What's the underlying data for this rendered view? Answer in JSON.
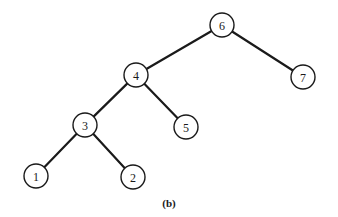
{
  "diagram": {
    "type": "binary-tree",
    "caption": "(b)",
    "node_radius": 12,
    "nodes": [
      {
        "id": "6",
        "label": "6",
        "x": 222,
        "y": 25
      },
      {
        "id": "4",
        "label": "4",
        "x": 136,
        "y": 75
      },
      {
        "id": "7",
        "label": "7",
        "x": 303,
        "y": 77
      },
      {
        "id": "3",
        "label": "3",
        "x": 85,
        "y": 125
      },
      {
        "id": "5",
        "label": "5",
        "x": 186,
        "y": 127
      },
      {
        "id": "1",
        "label": "1",
        "x": 36,
        "y": 176
      },
      {
        "id": "2",
        "label": "2",
        "x": 133,
        "y": 177
      }
    ],
    "edges": [
      {
        "from": "6",
        "to": "4"
      },
      {
        "from": "6",
        "to": "7"
      },
      {
        "from": "4",
        "to": "3"
      },
      {
        "from": "4",
        "to": "5"
      },
      {
        "from": "3",
        "to": "1"
      },
      {
        "from": "3",
        "to": "2"
      }
    ]
  }
}
